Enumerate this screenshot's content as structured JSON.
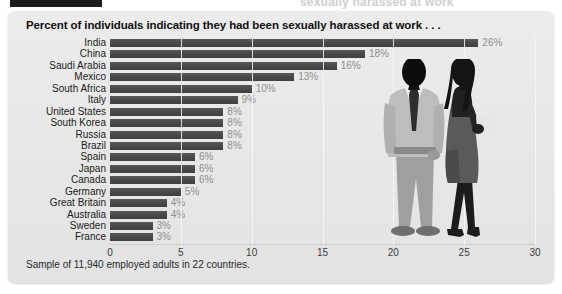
{
  "top_strip": {
    "ghost_text": "sexually harassed at work"
  },
  "panel": {
    "title": "Percent of individuals indicating they had been sexually harassed at work . . .",
    "footnote": "Sample of 11,940 employed adults in 22 countries."
  },
  "colors": {
    "bar": "#4a4a4a",
    "panel_background": "#e9e9e9",
    "value_label": "#8e8e8e",
    "category_label": "#1a1a1a",
    "gridline": "#f7f7f7",
    "figure_man_suit": "#b3b3b3",
    "figure_man_dark": "#0d0d0d",
    "figure_woman": "#4a4a4a",
    "figure_woman_hair": "#141414"
  },
  "chart_data": {
    "type": "bar",
    "orientation": "horizontal",
    "title": "Percent of individuals indicating they had been sexually harassed at work . . .",
    "subtitle": "",
    "xlabel": "",
    "ylabel": "",
    "xlim": [
      0,
      30
    ],
    "xticks": [
      0,
      5,
      10,
      15,
      20,
      25,
      30
    ],
    "xtick_labels": [
      "0",
      "5",
      "10",
      "15",
      "20",
      "25",
      "30"
    ],
    "grid": true,
    "legend": false,
    "note": "Sample of 11,940 employed adults in 22 countries.",
    "categories": [
      "India",
      "China",
      "Saudi Arabia",
      "Mexico",
      "South Africa",
      "Italy",
      "United States",
      "South Korea",
      "Russia",
      "Brazil",
      "Spain",
      "Japan",
      "Canada",
      "Germany",
      "Great Britain",
      "Australia",
      "Sweden",
      "France"
    ],
    "values": [
      26,
      18,
      16,
      13,
      10,
      9,
      8,
      8,
      8,
      8,
      6,
      6,
      6,
      5,
      4,
      4,
      3,
      3
    ],
    "value_labels": [
      "26%",
      "18%",
      "16%",
      "13%",
      "10%",
      "9%",
      "8%",
      "8%",
      "8%",
      "8%",
      "6%",
      "6%",
      "6%",
      "5%",
      "4%",
      "4%",
      "3%",
      "3%"
    ]
  }
}
